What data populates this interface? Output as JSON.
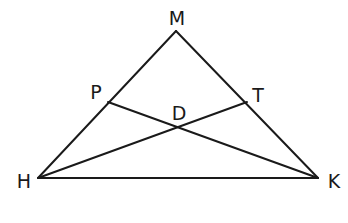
{
  "diagram": {
    "type": "triangle-with-cevians",
    "points": {
      "M": {
        "label": "M",
        "x": 176,
        "y": 31
      },
      "H": {
        "label": "H",
        "x": 38,
        "y": 178
      },
      "K": {
        "label": "K",
        "x": 318,
        "y": 178
      },
      "P": {
        "label": "P",
        "x": 108,
        "y": 102
      },
      "T": {
        "label": "T",
        "x": 247,
        "y": 102
      },
      "D": {
        "label": "D",
        "x": 178,
        "y": 126
      }
    },
    "segments": [
      [
        "M",
        "H"
      ],
      [
        "M",
        "K"
      ],
      [
        "H",
        "K"
      ],
      [
        "P",
        "K"
      ],
      [
        "H",
        "T"
      ]
    ],
    "labels": {
      "M": "M",
      "P": "P",
      "T": "T",
      "D": "D",
      "H": "H",
      "K": "K"
    },
    "colors": {
      "stroke": "#1a1a1a",
      "background": "#ffffff"
    }
  }
}
